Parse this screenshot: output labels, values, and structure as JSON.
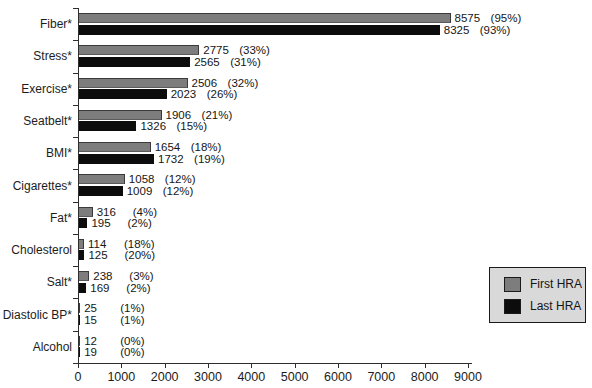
{
  "chart_data": {
    "type": "bar",
    "orientation": "horizontal",
    "title": "",
    "xlabel": "",
    "ylabel": "",
    "xlim": [
      0,
      9000
    ],
    "xticks": [
      0,
      1000,
      2000,
      3000,
      4000,
      5000,
      6000,
      7000,
      8000,
      9000
    ],
    "grid": false,
    "categories": [
      "Fiber*",
      "Stress*",
      "Exercise*",
      "Seatbelt*",
      "BMI*",
      "Cigarettes*",
      "Fat*",
      "Cholesterol",
      "Salt*",
      "Diastolic BP*",
      "Alcohol"
    ],
    "series": [
      {
        "name": "First HRA",
        "color": "#7d7d7d",
        "values": [
          8575,
          2775,
          2506,
          1906,
          1654,
          1058,
          316,
          114,
          238,
          25,
          12
        ],
        "percent_labels": [
          "(95%)",
          "(33%)",
          "(32%)",
          "(21%)",
          "(18%)",
          "(12%)",
          "(4%)",
          "(18%)",
          "(3%)",
          "(1%)",
          "(0%)"
        ]
      },
      {
        "name": "Last HRA",
        "color": "#0c0c0c",
        "values": [
          8325,
          2565,
          2023,
          1326,
          1732,
          1009,
          195,
          125,
          169,
          15,
          19
        ],
        "percent_labels": [
          "(93%)",
          "(31%)",
          "(26%)",
          "(15%)",
          "(19%)",
          "(12%)",
          "(2%)",
          "(20%)",
          "(2%)",
          "(1%)",
          "(0%)"
        ]
      }
    ],
    "legend": {
      "position": "right-middle",
      "background": "#d9d9d9",
      "entries": [
        "First HRA",
        "Last HRA"
      ]
    }
  }
}
